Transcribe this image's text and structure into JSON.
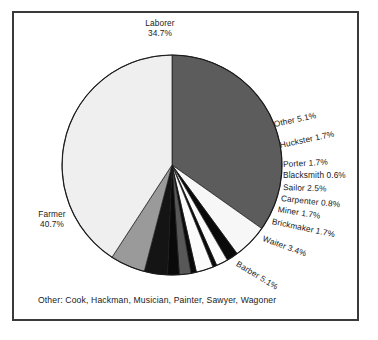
{
  "figure": {
    "background_color": "#ffffff",
    "frame_color": "#3a3a3a",
    "footnote": "Other: Cook, Hackman, Musician, Painter, Sawyer, Wagoner"
  },
  "labels": {
    "laborer": "Laborer",
    "laborer_pct": "34.7%",
    "farmer": "Farmer",
    "farmer_pct": "40.7%",
    "other": "Other 5.1%",
    "huckster": "Huckster 1.7%",
    "porter": "Porter 1.7%",
    "blacksmith": "Blacksmith 0.6%",
    "sailor": "Sailor 2.5%",
    "carpenter": "Carpenter 0.8%",
    "miner": "Miner 1.7%",
    "brickmaker": "Brickmaker 1.7%",
    "waiter": "Waiter 3.4%",
    "barber": "Barber 5.1%"
  },
  "chart_data": {
    "type": "pie",
    "title": "",
    "subtitle": "",
    "xlabel": "",
    "ylabel": "",
    "grid": false,
    "legend_position": "none",
    "labels_outside": true,
    "start_angle_deg": -90,
    "direction": "clockwise",
    "center": {
      "x": 172,
      "y": 165
    },
    "radius": 110,
    "footnote": "Other: Cook, Hackman, Musician, Painter, Sawyer, Wagoner",
    "other_breakdown": [
      "Cook",
      "Hackman",
      "Musician",
      "Painter",
      "Sawyer",
      "Wagoner"
    ],
    "slices": [
      {
        "name": "Laborer",
        "value": 34.7,
        "label": "Laborer 34.7%",
        "color": "#5c5c5c"
      },
      {
        "name": "Other",
        "value": 5.1,
        "label": "Other 5.1%",
        "color": "#f7f7f7"
      },
      {
        "name": "Huckster",
        "value": 1.7,
        "label": "Huckster 1.7%",
        "color": "#0a0a0a"
      },
      {
        "name": "Porter",
        "value": 1.7,
        "label": "Porter 1.7%",
        "color": "#fbfbfb"
      },
      {
        "name": "Blacksmith",
        "value": 0.6,
        "label": "Blacksmith 0.6%",
        "color": "#0a0a0a"
      },
      {
        "name": "Sailor",
        "value": 2.5,
        "label": "Sailor 2.5%",
        "color": "#fbfbfb"
      },
      {
        "name": "Carpenter",
        "value": 0.8,
        "label": "Carpenter 0.8%",
        "color": "#0a0a0a"
      },
      {
        "name": "Miner",
        "value": 1.7,
        "label": "Miner 1.7%",
        "color": "#585858"
      },
      {
        "name": "Brickmaker",
        "value": 1.7,
        "label": "Brickmaker 1.7%",
        "color": "#0a0a0a"
      },
      {
        "name": "Waiter",
        "value": 3.4,
        "label": "Waiter 3.4%",
        "color": "#141414"
      },
      {
        "name": "Barber",
        "value": 5.1,
        "label": "Barber 5.1%",
        "color": "#9a9a9a"
      },
      {
        "name": "Farmer",
        "value": 40.7,
        "label": "Farmer 40.7%",
        "color": "#efefef"
      }
    ],
    "values": [
      34.7,
      5.1,
      1.7,
      1.7,
      0.6,
      2.5,
      0.8,
      1.7,
      1.7,
      3.4,
      5.1,
      40.7
    ],
    "categories": [
      "Laborer",
      "Other",
      "Huckster",
      "Porter",
      "Blacksmith",
      "Sailor",
      "Carpenter",
      "Miner",
      "Brickmaker",
      "Waiter",
      "Barber",
      "Farmer"
    ]
  }
}
